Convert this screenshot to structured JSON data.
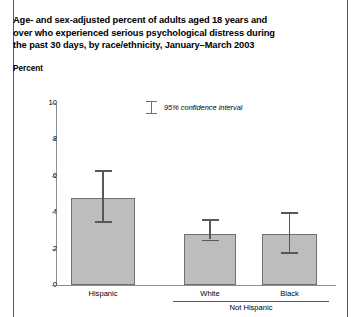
{
  "figure": {
    "title_lines": [
      "Age- and sex-adjusted percent of adults aged 18 years and",
      "over who experienced serious psychological distress during",
      "the past 30 days, by race/ethnicity, January–March 2003"
    ],
    "axis_title": "Percent",
    "legend_label": "95% confidence interval",
    "group_label": "Not Hispanic"
  },
  "chart_data": {
    "type": "bar",
    "title": "Age- and sex-adjusted percent of adults aged 18 years and over who experienced serious psychological distress during the past 30 days, by race/ethnicity, January–March 2003",
    "xlabel": "",
    "ylabel": "Percent",
    "ylim": [
      0,
      10
    ],
    "yticks": [
      0,
      2,
      4,
      6,
      8,
      10
    ],
    "ytick_labels": [
      "0",
      "2",
      "4",
      "6",
      "8",
      "10"
    ],
    "grid": false,
    "legend_position": "upper-center",
    "categories": [
      "Hispanic",
      "White",
      "Black"
    ],
    "groups": [
      {
        "label": "Not Hispanic",
        "categories": [
          "White",
          "Black"
        ]
      }
    ],
    "values": [
      4.8,
      2.8,
      2.8
    ],
    "errors_low": [
      3.5,
      2.5,
      1.8
    ],
    "errors_high": [
      6.3,
      3.6,
      4.0
    ],
    "error_type": "95% confidence interval",
    "bar_color": "#bdbdbd",
    "bar_edge_color": "#6e7277"
  }
}
